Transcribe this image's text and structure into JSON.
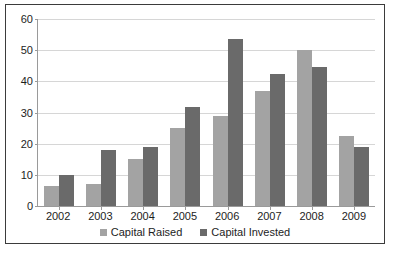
{
  "chart_data": {
    "type": "bar",
    "title": "",
    "subtitle": "",
    "xlabel": "",
    "ylabel": "",
    "ylim": [
      0,
      60
    ],
    "yticks": [
      0,
      10,
      20,
      30,
      40,
      50,
      60
    ],
    "grid": true,
    "legend_position": "bottom",
    "categories": [
      "2002",
      "2003",
      "2004",
      "2005",
      "2006",
      "2007",
      "2008",
      "2009"
    ],
    "series": [
      {
        "name": "Capital Raised",
        "color": "#a3a3a3",
        "values": [
          6.5,
          7.2,
          15,
          25,
          29,
          37,
          50,
          22.5
        ]
      },
      {
        "name": "Capital Invested",
        "color": "#6a6a6a",
        "values": [
          10,
          18,
          19,
          31.8,
          53.5,
          42.5,
          44.5,
          19
        ]
      }
    ]
  },
  "legend": {
    "items": [
      {
        "label": "Capital Raised",
        "swatch": "raised"
      },
      {
        "label": "Capital Invested",
        "swatch": "invested"
      }
    ]
  },
  "colors": {
    "series_raised": "#a3a3a3",
    "series_invested": "#6a6a6a",
    "gridline": "#d6d6d6",
    "axis": "#9a9a9a",
    "border": "#3b3b3b",
    "text": "#1d1d1d",
    "background": "#ffffff"
  }
}
